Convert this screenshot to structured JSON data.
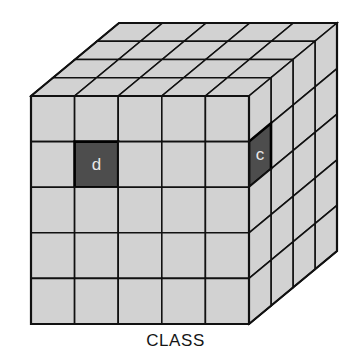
{
  "diagram": {
    "type": "3d-cube-grid",
    "caption": "CLASS",
    "title": "CLASS",
    "geometry": {
      "front_origin_x": 31,
      "front_origin_y": 96,
      "front_width": 218,
      "front_height": 228,
      "depth_dx": 88,
      "depth_dy": -73,
      "front_cols": 5,
      "front_rows": 5,
      "depth_steps": 4
    },
    "colors": {
      "cell_fill": "#d2d2d2",
      "cell_dark_fill": "#4d4d4d",
      "stroke": "#111111",
      "label_light": "#e8e8e8",
      "background": "#ffffff",
      "caption_color": "#151515"
    },
    "highlighted_cells": [
      {
        "id": "d",
        "label": "d",
        "face": "front",
        "col": 2,
        "row": 2
      },
      {
        "id": "c",
        "label": "c",
        "face": "right",
        "depth_col": 1,
        "row": 2
      }
    ],
    "faces": [
      {
        "name": "front",
        "cols": 5,
        "rows": 5
      },
      {
        "name": "top",
        "cols": 5,
        "rows": 4
      },
      {
        "name": "right",
        "cols": 4,
        "rows": 5
      }
    ]
  }
}
